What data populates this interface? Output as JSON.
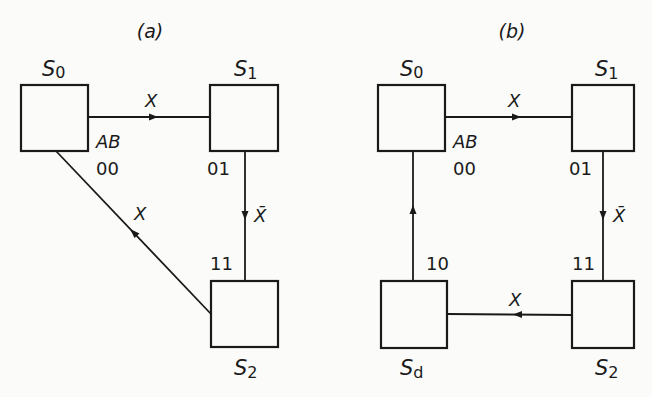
{
  "figure": {
    "panels": [
      {
        "id": "a",
        "caption": "(a)",
        "header": "AB",
        "states": [
          {
            "name": "S",
            "sub": "0",
            "code": "00"
          },
          {
            "name": "S",
            "sub": "1",
            "code": "01"
          },
          {
            "name": "S",
            "sub": "2",
            "code": "11"
          }
        ],
        "transitions": [
          {
            "from": "S0",
            "to": "S1",
            "label": "X"
          },
          {
            "from": "S1",
            "to": "S2",
            "label": "X̄"
          },
          {
            "from": "S2",
            "to": "S0",
            "label": "X"
          }
        ]
      },
      {
        "id": "b",
        "caption": "(b)",
        "header": "AB",
        "states": [
          {
            "name": "S",
            "sub": "0",
            "code": "00"
          },
          {
            "name": "S",
            "sub": "1",
            "code": "01"
          },
          {
            "name": "S",
            "sub": "2",
            "code": "11"
          },
          {
            "name": "S",
            "sub": "d",
            "code": "10"
          }
        ],
        "transitions": [
          {
            "from": "S0",
            "to": "S1",
            "label": "X"
          },
          {
            "from": "S1",
            "to": "S2",
            "label": "X̄"
          },
          {
            "from": "S2",
            "to": "Sd",
            "label": "X"
          },
          {
            "from": "Sd",
            "to": "S0",
            "label": ""
          }
        ]
      }
    ]
  }
}
